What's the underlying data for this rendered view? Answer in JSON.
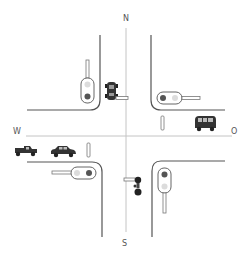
{
  "diagram": {
    "type": "traffic-intersection",
    "compass": {
      "north": "N",
      "south": "S",
      "west": "W",
      "east": "O"
    },
    "colors": {
      "road_edge": "#555555",
      "center_line": "#bbbbbb",
      "light_red": "#555555",
      "light_off": "#d8d8d8",
      "vehicle": "#333333"
    },
    "traffic_lights": [
      {
        "id": "nw",
        "orientation": "vertical",
        "facing": "south",
        "active": "bottom"
      },
      {
        "id": "ne",
        "orientation": "horizontal",
        "facing": "west",
        "active": "left"
      },
      {
        "id": "sw",
        "orientation": "horizontal",
        "facing": "east",
        "active": "right"
      },
      {
        "id": "se",
        "orientation": "vertical",
        "facing": "north",
        "active": "top"
      }
    ],
    "vehicles": [
      {
        "id": "car-north",
        "kind": "car",
        "lane": "north, southbound",
        "position": "near stop line"
      },
      {
        "id": "van-east",
        "kind": "van",
        "lane": "east, westbound",
        "position": "near stop line"
      },
      {
        "id": "truck-west",
        "kind": "pickup-truck",
        "lane": "west, eastbound",
        "position": "queued"
      },
      {
        "id": "car-west",
        "kind": "car",
        "lane": "west, eastbound",
        "position": "near stop line"
      },
      {
        "id": "bicycle-south",
        "kind": "bicycle",
        "lane": "south, northbound",
        "position": "near stop line"
      }
    ]
  }
}
